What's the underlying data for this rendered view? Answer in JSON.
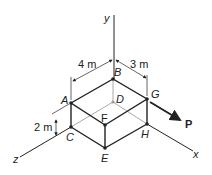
{
  "diagram": {
    "axes": {
      "x": "x",
      "y": "y",
      "z": "z"
    },
    "points": {
      "A": "A",
      "B": "B",
      "C": "C",
      "D": "D",
      "E": "E",
      "F": "F",
      "G": "G",
      "H": "H"
    },
    "dimensions": {
      "width_x": "3 m",
      "width_z": "4 m",
      "height": "2 m"
    },
    "force": {
      "label": "P",
      "applied_at": "G"
    },
    "colors": {
      "line": "#222222",
      "hidden": "#aaaaaa"
    }
  }
}
